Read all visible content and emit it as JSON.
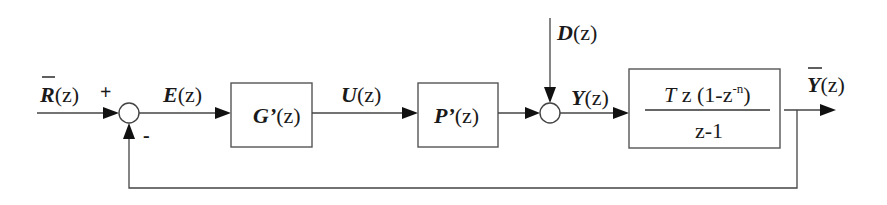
{
  "diagram": {
    "type": "block-diagram",
    "topology": "closed-loop feedback with disturbance",
    "signals": {
      "reference": {
        "symbol": "R",
        "arg": "(z)",
        "overbar": true
      },
      "error": {
        "symbol": "E",
        "arg": "(z)"
      },
      "control": {
        "symbol": "U",
        "arg": "(z)"
      },
      "disturbance": {
        "symbol": "D",
        "arg": "(z)"
      },
      "plant_out": {
        "symbol": "Y",
        "arg": "(z)"
      },
      "output": {
        "symbol": "Y",
        "arg": "(z)",
        "overbar": true
      }
    },
    "junctions": {
      "sum1": {
        "plus_sign": "+",
        "minus_sign": "-"
      },
      "sum2": {}
    },
    "blocks": {
      "controller": {
        "symbol": "G’",
        "arg": "(z)"
      },
      "plant": {
        "symbol": "P’",
        "arg": "(z)"
      },
      "hold": {
        "numerator_T": "T",
        "numerator_rest": " z (1-z",
        "numerator_exp": "-n",
        "numerator_close": ")",
        "denominator": "z-1"
      }
    },
    "colors": {
      "line": "#444444",
      "arrow": "#111111",
      "text": "#1a1a1a",
      "background": "#ffffff"
    }
  }
}
